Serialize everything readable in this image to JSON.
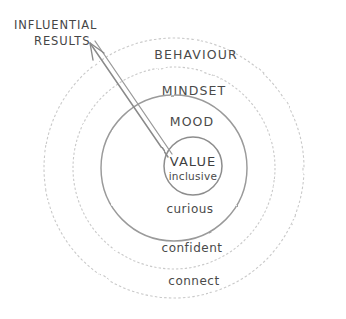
{
  "diagram": {
    "title_visible": false,
    "background_color": "#ffffff",
    "stroke_color": "#8d8d8d",
    "faint_stroke_color": "#c9c9c9",
    "text_color": "#4a4a4a",
    "center": {
      "x": 174,
      "y": 168
    },
    "rings": [
      {
        "id": "behaviour",
        "label": "BEHAVIOUR",
        "case": "upper",
        "radius": 130,
        "label_x": 196,
        "label_y": 59,
        "stroke": "#c9c9c9",
        "dashed": true
      },
      {
        "id": "mindset",
        "label": "MINDSET",
        "case": "upper",
        "radius": 101,
        "label_x": 194,
        "label_y": 95,
        "stroke": "#c9c9c9",
        "dashed": true
      },
      {
        "id": "mood",
        "label": "MOOD",
        "case": "upper",
        "radius": 73,
        "label_x": 192,
        "label_y": 126,
        "stroke": "#9a9a9a",
        "dashed": false
      }
    ],
    "outer_labels": [
      {
        "id": "curious",
        "label": "curious",
        "label_x": 190,
        "label_y": 213,
        "ring_id": "mood"
      },
      {
        "id": "confident",
        "label": "confident",
        "label_x": 192,
        "label_y": 252,
        "ring_id": "mindset"
      },
      {
        "id": "connect",
        "label": "connect",
        "label_x": 194,
        "label_y": 285,
        "ring_id": "behaviour"
      }
    ],
    "core": {
      "id": "value",
      "title": "VALUE",
      "subtitle": "inclusive",
      "center_x": 193,
      "center_y": 166,
      "radius": 29,
      "title_y": 166,
      "subtitle_y": 180,
      "stroke": "#8d8d8d"
    },
    "callout": {
      "lines": [
        "INFLUENTIAL",
        "RESULTS"
      ],
      "line1_x": 14,
      "line1_y": 29,
      "line2_x": 34,
      "line2_y": 45,
      "arrow": {
        "tail_x": 168,
        "tail_y": 157,
        "head_x": 90,
        "head_y": 43,
        "stroke": "#8a8a8a",
        "double_line": true,
        "head_at": "top-left"
      }
    }
  }
}
